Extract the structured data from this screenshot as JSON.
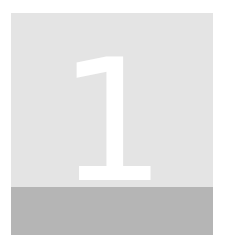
{
  "tile": {
    "number": "1",
    "colors": {
      "page_background": "#ffffff",
      "square_background": "#e4e4e4",
      "band_background": "#b5b5b5",
      "numeral": "#ffffff"
    }
  }
}
